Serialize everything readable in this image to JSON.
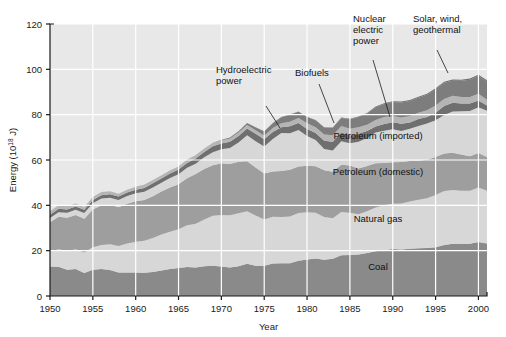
{
  "chart_data": {
    "type": "area",
    "title": "",
    "subtitle": "",
    "xlabel": "Year",
    "ylabel": "Energy (10¹⁸ J)",
    "ylabel_base": "Energy (10",
    "ylabel_exp": "18",
    "ylabel_tail": " J)",
    "xlim": [
      1950,
      2001
    ],
    "ylim": [
      0,
      120
    ],
    "grid": true,
    "stacked": true,
    "legend_position": "inline-annotations",
    "xticks": [
      1950,
      1955,
      1960,
      1965,
      1970,
      1975,
      1980,
      1985,
      1990,
      1995,
      2000
    ],
    "xtick_labels": [
      "1950",
      "1955",
      "1960",
      "1965",
      "1970",
      "1975",
      "1980",
      "1985",
      "1990",
      "1995",
      "2000"
    ],
    "yticks": [
      0,
      20,
      40,
      60,
      80,
      100,
      120
    ],
    "ytick_labels": [
      "0",
      "20",
      "40",
      "60",
      "80",
      "100",
      "120"
    ],
    "x": [
      1950,
      1951,
      1952,
      1953,
      1954,
      1955,
      1956,
      1957,
      1958,
      1959,
      1960,
      1961,
      1962,
      1963,
      1964,
      1965,
      1966,
      1967,
      1968,
      1969,
      1970,
      1971,
      1972,
      1973,
      1974,
      1975,
      1976,
      1977,
      1978,
      1979,
      1980,
      1981,
      1982,
      1983,
      1984,
      1985,
      1986,
      1987,
      1988,
      1989,
      1990,
      1991,
      1992,
      1993,
      1994,
      1995,
      1996,
      1997,
      1998,
      1999,
      2000,
      2001
    ],
    "series": [
      {
        "name": "Coal",
        "color": "#8a8a8a",
        "label_x": 1988,
        "label_y": 11,
        "values": [
          13.0,
          12.9,
          11.6,
          11.9,
          10.2,
          11.6,
          11.9,
          11.5,
          10.4,
          10.4,
          10.4,
          10.3,
          10.6,
          11.3,
          11.9,
          12.3,
          12.8,
          12.6,
          13.1,
          13.4,
          13.0,
          12.6,
          13.1,
          14.2,
          13.4,
          13.4,
          14.3,
          14.5,
          14.5,
          15.6,
          16.1,
          16.5,
          16.0,
          16.4,
          18.0,
          18.1,
          18.3,
          19.0,
          19.7,
          20.2,
          20.7,
          20.5,
          20.8,
          21.1,
          21.2,
          21.5,
          22.5,
          23.1,
          23.1,
          23.1,
          23.8,
          23.2
        ]
      },
      {
        "name": "Natural gas",
        "color": "#d7d7d7",
        "label_x": 1988,
        "label_y": 32,
        "values": [
          6.5,
          7.7,
          8.2,
          8.7,
          9.0,
          9.9,
          10.6,
          11.3,
          11.7,
          12.8,
          13.5,
          14.1,
          15.0,
          15.8,
          16.5,
          17.1,
          18.4,
          19.3,
          20.6,
          22.0,
          22.7,
          23.0,
          23.4,
          23.2,
          22.1,
          20.4,
          20.7,
          20.3,
          20.6,
          21.0,
          20.9,
          20.2,
          18.9,
          17.9,
          19.1,
          18.6,
          17.8,
          18.4,
          19.3,
          20.0,
          20.0,
          20.3,
          20.9,
          21.4,
          21.9,
          23.1,
          23.8,
          23.7,
          23.3,
          23.3,
          24.1,
          23.2
        ]
      },
      {
        "name": "Petroleum (domestic)",
        "color": "#9e9e9e",
        "label_x": 1988,
        "label_y": 52,
        "values": [
          13.0,
          14.4,
          14.7,
          15.1,
          14.9,
          16.7,
          17.5,
          17.5,
          17.0,
          17.5,
          17.9,
          18.0,
          18.4,
          19.0,
          19.5,
          19.9,
          20.8,
          21.9,
          22.3,
          22.3,
          22.9,
          22.6,
          22.7,
          22.1,
          21.2,
          20.2,
          19.9,
          20.3,
          20.6,
          20.5,
          20.5,
          20.5,
          20.6,
          20.5,
          20.8,
          20.9,
          20.2,
          19.9,
          19.6,
          18.5,
          18.3,
          18.3,
          17.9,
          17.2,
          17.0,
          16.7,
          16.6,
          16.4,
          16.0,
          15.3,
          15.2,
          14.9
        ]
      },
      {
        "name": "Petroleum (imported)",
        "color": "#d7d7d7",
        "label_x": 1988,
        "label_y": 70,
        "values": [
          1.9,
          2.0,
          2.2,
          2.4,
          2.5,
          2.7,
          3.0,
          3.0,
          3.2,
          3.4,
          3.5,
          3.6,
          3.9,
          3.9,
          4.2,
          4.4,
          4.6,
          4.6,
          5.2,
          5.7,
          6.1,
          7.1,
          8.5,
          11.4,
          11.6,
          12.0,
          14.4,
          16.8,
          16.1,
          16.1,
          13.1,
          11.6,
          9.4,
          9.4,
          10.4,
          9.8,
          11.7,
          12.4,
          13.5,
          14.2,
          14.6,
          13.7,
          14.2,
          15.3,
          16.0,
          16.2,
          17.0,
          18.2,
          19.1,
          19.9,
          20.2,
          20.4
        ]
      },
      {
        "name": "Hydroelectric power",
        "color": "#6f6f6f",
        "callout": true,
        "callout_lines": [
          "Hydroelectric",
          "power"
        ],
        "values": [
          1.4,
          1.5,
          1.5,
          1.4,
          1.4,
          1.4,
          1.5,
          1.6,
          1.6,
          1.6,
          1.6,
          1.7,
          1.8,
          1.8,
          1.9,
          2.1,
          2.1,
          2.3,
          2.3,
          2.7,
          2.6,
          2.8,
          2.9,
          3.0,
          3.3,
          3.2,
          3.1,
          2.5,
          3.1,
          3.1,
          3.1,
          3.1,
          3.6,
          3.9,
          3.8,
          3.4,
          3.6,
          3.1,
          2.7,
          3.0,
          3.1,
          3.2,
          2.7,
          3.1,
          2.9,
          3.4,
          3.9,
          3.9,
          3.4,
          3.3,
          2.9,
          2.3
        ]
      },
      {
        "name": "Biofuels",
        "color": "#b5b5b5",
        "callout": true,
        "callout_lines": [
          "Biofuels"
        ],
        "values": [
          1.6,
          1.5,
          1.4,
          1.3,
          1.3,
          1.4,
          1.4,
          1.3,
          1.2,
          1.2,
          1.3,
          1.3,
          1.3,
          1.3,
          1.3,
          1.3,
          1.3,
          1.3,
          1.3,
          1.3,
          1.4,
          1.4,
          1.5,
          1.5,
          1.5,
          1.5,
          1.7,
          1.8,
          2.0,
          2.2,
          2.5,
          2.6,
          2.7,
          2.8,
          2.9,
          3.0,
          2.9,
          2.8,
          2.9,
          3.1,
          2.7,
          2.8,
          2.9,
          2.8,
          2.9,
          3.1,
          3.1,
          3.0,
          2.9,
          2.9,
          3.0,
          2.6
        ]
      },
      {
        "name": "Nuclear electric power",
        "color": "#7d7d7d",
        "callout": true,
        "callout_lines": [
          "Nuclear",
          "electric",
          "power"
        ],
        "values": [
          0.0,
          0.0,
          0.0,
          0.0,
          0.0,
          0.0,
          0.0,
          0.02,
          0.02,
          0.02,
          0.02,
          0.03,
          0.03,
          0.04,
          0.04,
          0.04,
          0.06,
          0.09,
          0.14,
          0.15,
          0.24,
          0.42,
          0.58,
          0.91,
          1.27,
          1.9,
          2.11,
          2.7,
          3.08,
          2.78,
          2.74,
          3.01,
          3.13,
          3.2,
          3.55,
          4.15,
          4.47,
          4.91,
          5.59,
          5.68,
          6.16,
          6.58,
          6.61,
          6.52,
          6.84,
          7.18,
          7.17,
          6.68,
          7.15,
          7.61,
          7.86,
          8.03
        ]
      },
      {
        "name": "Solar, wind, geothermal",
        "color": "#6f6f6f",
        "callout": true,
        "callout_lines": [
          "Solar, wind,",
          "geothermal"
        ],
        "values": [
          0.0,
          0.0,
          0.0,
          0.0,
          0.0,
          0.0,
          0.0,
          0.0,
          0.0,
          0.0,
          0.0,
          0.0,
          0.0,
          0.0,
          0.0,
          0.0,
          0.0,
          0.0,
          0.0,
          0.0,
          0.0,
          0.0,
          0.03,
          0.04,
          0.05,
          0.07,
          0.08,
          0.08,
          0.08,
          0.09,
          0.11,
          0.13,
          0.15,
          0.19,
          0.22,
          0.26,
          0.25,
          0.25,
          0.26,
          0.33,
          0.36,
          0.4,
          0.43,
          0.45,
          0.46,
          0.47,
          0.48,
          0.48,
          0.49,
          0.5,
          0.51,
          0.5
        ]
      }
    ],
    "annotations": [
      {
        "text_lines": [
          "Hydroelectric",
          "power"
        ],
        "series": "Hydroelectric power",
        "tx": 216,
        "ty": 73,
        "lx": 266,
        "ly": 106,
        "px": 280,
        "py": 128
      },
      {
        "text_lines": [
          "Biofuels"
        ],
        "series": "Biofuels",
        "tx": 295,
        "ty": 76,
        "lx": 319,
        "ly": 84,
        "px": 334,
        "py": 123
      },
      {
        "text_lines": [
          "Nuclear",
          "electric",
          "power"
        ],
        "series": "Nuclear electric power",
        "tx": 353,
        "ty": 22,
        "lx": 373,
        "ly": 60,
        "px": 390,
        "py": 117
      },
      {
        "text_lines": [
          "Solar, wind,",
          "geothermal"
        ],
        "series": "Solar, wind, geothermal",
        "tx": 413,
        "ty": 22,
        "lx": 437,
        "ly": 50,
        "px": 448,
        "py": 73
      }
    ],
    "inline_labels": [
      {
        "text": "Petroleum (imported)",
        "x": 378,
        "y": 139
      },
      {
        "text": "Petroleum (domestic)",
        "x": 378,
        "y": 175
      },
      {
        "text": "Natural gas",
        "x": 378,
        "y": 222
      },
      {
        "text": "Coal",
        "x": 378,
        "y": 270
      }
    ]
  }
}
